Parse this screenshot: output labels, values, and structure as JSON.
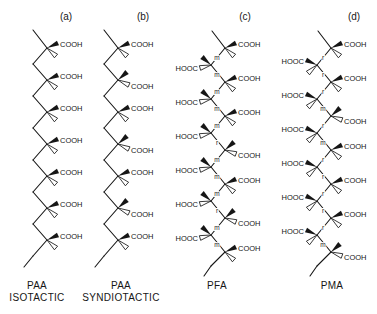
{
  "figure": {
    "colors": {
      "ink": "#161616",
      "background": "#ffffff"
    },
    "labels": {
      "cooh": "COOH",
      "hooc": "HOOC",
      "meso": "m",
      "racemo": "r"
    },
    "panels": [
      {
        "id": "a",
        "header": "(a)",
        "caption": [
          "PAA",
          "ISOTACTIC"
        ],
        "kind": "paa",
        "units": [
          "up",
          "up",
          "up",
          "up",
          "up",
          "up",
          "up"
        ]
      },
      {
        "id": "b",
        "header": "(b)",
        "caption": [
          "PAA",
          "SYNDIOTACTIC"
        ],
        "kind": "paa",
        "units": [
          "up",
          "down",
          "up",
          "down",
          "up",
          "down",
          "up"
        ]
      },
      {
        "id": "c",
        "header": "(c)",
        "caption": [
          "PFA"
        ],
        "kind": "diacid",
        "centers": [
          "R-bold",
          "L-hash",
          "R-bold",
          "L-hash",
          "R-bold",
          "L-hash",
          "R-hash",
          "L-hash",
          "R-bold",
          "L-hash",
          "R-hash",
          "L-hash",
          "R-bold"
        ],
        "dyads": [
          "m",
          "m",
          "m",
          "m",
          "m",
          "r",
          "m",
          "m",
          "m",
          "r",
          "m",
          "m"
        ]
      },
      {
        "id": "d",
        "header": "(d)",
        "caption": [
          "PMA"
        ],
        "kind": "diacid",
        "centers": [
          "R-bold",
          "L-bold",
          "R-bold",
          "L-bold",
          "R-hash",
          "L-bold",
          "R-bold",
          "L-bold",
          "R-bold",
          "L-bold",
          "R-bold",
          "L-bold",
          "R-hash"
        ],
        "dyads": [
          "r",
          "r",
          "r",
          "m",
          "r",
          "m",
          "r",
          "r",
          "r",
          "r",
          "r",
          "m"
        ]
      }
    ]
  }
}
